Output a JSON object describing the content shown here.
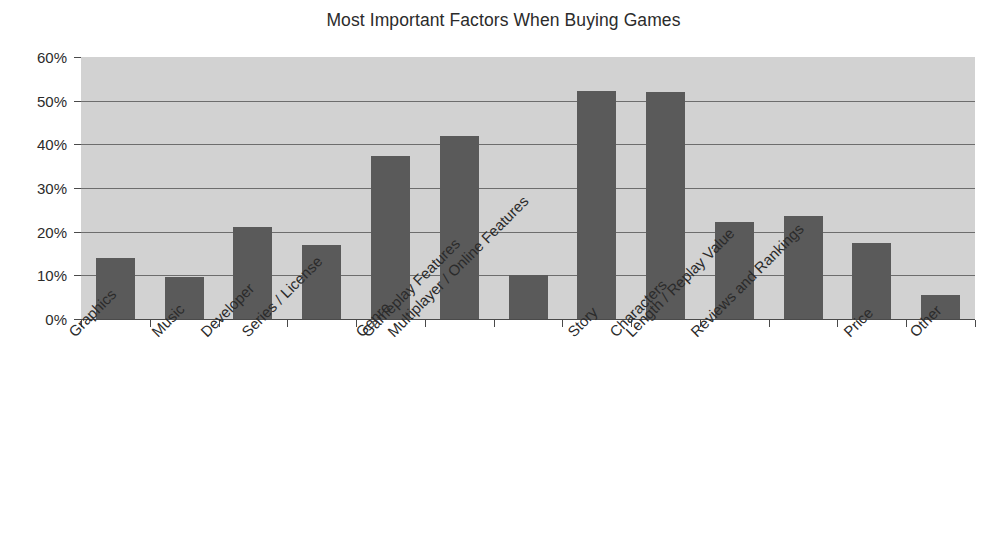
{
  "chart_data": {
    "type": "bar",
    "title": "Most Important Factors When Buying Games",
    "xlabel": "",
    "ylabel": "",
    "ylim": [
      0,
      60
    ],
    "ytick_labels": [
      "0%",
      "10%",
      "20%",
      "30%",
      "40%",
      "50%",
      "60%"
    ],
    "ytick_values": [
      0,
      10,
      20,
      30,
      40,
      50,
      60
    ],
    "grid": "horizontal",
    "legend": "none",
    "value_suffix": "%",
    "categories": [
      "Graphics",
      "Music",
      "Developer",
      "Series / License",
      "Genre",
      "Gameplay Features",
      "Multiplayer / Online Features",
      "Story",
      "Characters",
      "Length / Replay Value",
      "Reviews and Rankings",
      "Price",
      "Other"
    ],
    "values": [
      14,
      9.7,
      21,
      17,
      37.4,
      42,
      10,
      52.3,
      52,
      22.3,
      23.5,
      17.4,
      5.5
    ],
    "colors": {
      "bar": "#5a5a5a",
      "plot_background": "#d2d2d2",
      "gridline": "#6d6d6d",
      "axis": "#4a4a4a",
      "text": "#2b2b2b",
      "figure_background": "#ffffff"
    }
  }
}
